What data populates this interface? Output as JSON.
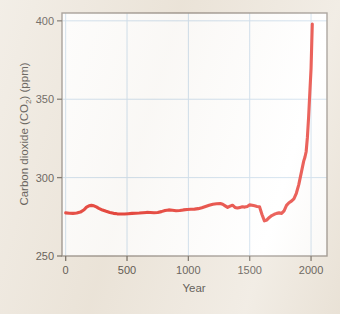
{
  "figure": {
    "background_color": "#ece5da",
    "plot_background_color": "#ffffff",
    "frame_color": "#8a8279",
    "gridline_color": "#c5d9ea",
    "series_color": "#e32219"
  },
  "chart_data": {
    "type": "line",
    "title": "",
    "xlabel": "Year",
    "ylabel": "Carbon dioxide (CO2) (ppm)",
    "ylabel_main": "Carbon dioxide (CO",
    "ylabel_subscript": "2",
    "ylabel_tail": ") (ppm)",
    "xlim": [
      -30,
      2130
    ],
    "ylim": [
      250,
      405
    ],
    "grid": true,
    "legend": "none",
    "xticks": [
      0,
      500,
      1000,
      1500,
      2000
    ],
    "xtick_labels": [
      "0",
      "500",
      "1000",
      "1500",
      "2000"
    ],
    "yticks": [
      250,
      300,
      350,
      400
    ],
    "ytick_labels": [
      "250",
      "300",
      "350",
      "400"
    ],
    "series": [
      {
        "name": "Atmospheric CO2 concentration",
        "color": "#e32219",
        "x": [
          0,
          30,
          60,
          90,
          120,
          150,
          170,
          190,
          210,
          230,
          250,
          270,
          300,
          330,
          360,
          390,
          420,
          450,
          480,
          510,
          540,
          570,
          600,
          630,
          660,
          690,
          720,
          750,
          780,
          810,
          840,
          870,
          900,
          930,
          960,
          990,
          1020,
          1050,
          1080,
          1110,
          1140,
          1170,
          1200,
          1230,
          1260,
          1280,
          1300,
          1320,
          1340,
          1360,
          1380,
          1400,
          1420,
          1440,
          1460,
          1480,
          1500,
          1520,
          1540,
          1560,
          1580,
          1600,
          1620,
          1640,
          1660,
          1680,
          1700,
          1720,
          1740,
          1760,
          1780,
          1800,
          1820,
          1840,
          1860,
          1880,
          1900,
          1920,
          1940,
          1950,
          1960,
          1970,
          1980,
          1990,
          2000,
          2010
        ],
        "y": [
          277.5,
          277.3,
          277.2,
          277.4,
          278.0,
          279.5,
          281.2,
          282.0,
          282.3,
          282.0,
          281.3,
          280.4,
          279.3,
          278.5,
          277.8,
          277.2,
          276.9,
          276.8,
          276.8,
          277.0,
          277.2,
          277.3,
          277.4,
          277.6,
          277.8,
          277.7,
          277.6,
          277.8,
          278.3,
          279.0,
          279.4,
          279.2,
          278.9,
          279.0,
          279.4,
          279.7,
          279.8,
          279.9,
          280.2,
          280.8,
          281.6,
          282.4,
          283.0,
          283.3,
          283.5,
          283.0,
          282.0,
          281.0,
          281.8,
          282.4,
          281.0,
          280.6,
          281.0,
          281.4,
          281.2,
          281.6,
          282.6,
          282.4,
          282.0,
          281.6,
          281.4,
          276.5,
          272.4,
          273.0,
          274.6,
          275.8,
          276.6,
          277.2,
          277.5,
          277.2,
          278.8,
          282.3,
          284.0,
          285.0,
          286.5,
          290.0,
          295.5,
          303.0,
          310.5,
          313.0,
          316.5,
          325.5,
          338.5,
          354.0,
          369.5,
          398.0
        ]
      }
    ]
  },
  "axis": {
    "x_title": "Year",
    "y_title_parts": {
      "main": "Carbon dioxide (CO",
      "sub": "2",
      "tail": ") (ppm)"
    }
  }
}
